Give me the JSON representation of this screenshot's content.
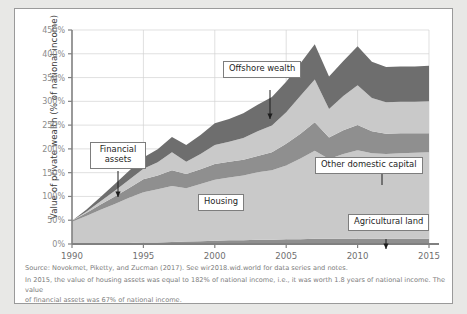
{
  "chart_data": {
    "type": "area",
    "stacked": true,
    "title": "",
    "subtitle": "",
    "xlabel": "",
    "ylabel": "Value of private wealth (% of national income)",
    "xlim": [
      1990,
      2015
    ],
    "ylim": [
      0,
      450
    ],
    "ytick_labels": [
      "0%",
      "50%",
      "100%",
      "150%",
      "200%",
      "250%",
      "300%",
      "350%",
      "400%",
      "450%"
    ],
    "ytick_values": [
      0,
      50,
      100,
      150,
      200,
      250,
      300,
      350,
      400,
      450
    ],
    "xtick_labels": [
      "1990",
      "1995",
      "2000",
      "2005",
      "2010",
      "2015"
    ],
    "xtick_values": [
      1990,
      1995,
      2000,
      2005,
      2010,
      2015
    ],
    "grid": true,
    "legend_position": "annotations",
    "x": [
      1990,
      1991,
      1992,
      1993,
      1994,
      1995,
      1996,
      1997,
      1998,
      1999,
      2000,
      2001,
      2002,
      2003,
      2004,
      2005,
      2006,
      2007,
      2008,
      2009,
      2010,
      2011,
      2012,
      2013,
      2014,
      2015
    ],
    "series": [
      {
        "name": "Agricultural land",
        "color": "#8f8f8f",
        "values": [
          2,
          2,
          2,
          2,
          2,
          3,
          3,
          4,
          5,
          6,
          7,
          8,
          8,
          9,
          9,
          10,
          10,
          11,
          11,
          11,
          11,
          11,
          11,
          11,
          11,
          11
        ]
      },
      {
        "name": "Housing",
        "color": "#c9c9c9",
        "values": [
          45,
          57,
          70,
          82,
          95,
          106,
          112,
          118,
          112,
          120,
          128,
          132,
          136,
          142,
          146,
          155,
          170,
          185,
          168,
          178,
          186,
          180,
          178,
          180,
          181,
          182
        ]
      },
      {
        "name": "Other domestic capital",
        "color": "#8f8f8f",
        "values": [
          2,
          6,
          11,
          16,
          21,
          27,
          29,
          33,
          30,
          31,
          33,
          33,
          33,
          34,
          38,
          46,
          52,
          60,
          45,
          50,
          53,
          46,
          43,
          42,
          41,
          40
        ]
      },
      {
        "name": "Financial assets",
        "color": "#c9c9c9",
        "values": [
          0,
          3,
          7,
          12,
          17,
          22,
          28,
          38,
          26,
          32,
          40,
          42,
          46,
          52,
          56,
          66,
          80,
          90,
          60,
          72,
          84,
          70,
          66,
          66,
          66,
          67
        ]
      },
      {
        "name": "Offshore wealth",
        "color": "#6e6e6e",
        "values": [
          0,
          4,
          9,
          14,
          19,
          24,
          27,
          32,
          35,
          40,
          46,
          48,
          52,
          56,
          60,
          64,
          68,
          74,
          68,
          74,
          82,
          76,
          74,
          74,
          74,
          75
        ]
      }
    ]
  },
  "annotations": [
    {
      "id": "financial-assets",
      "label": "Financial assets",
      "multiline": true
    },
    {
      "id": "offshore-wealth",
      "label": "Offshore wealth",
      "multiline": false
    },
    {
      "id": "housing",
      "label": "Housing",
      "multiline": false
    },
    {
      "id": "other-domestic-capital",
      "label": "Other domestic capital",
      "multiline": false
    },
    {
      "id": "agricultural-land",
      "label": "Agricultural land",
      "multiline": false
    }
  ],
  "footnotes": {
    "source": "Source:  Novokmet, Piketty, and Zucman (2017). See wir2018.wid.world for data series and notes.",
    "note_line1": "In 2015, the value of housing assets was equal to 182% of national income, i.e., it was worth 1.8 years of national income. The value",
    "note_line2": "of financial assets was 67% of national income."
  },
  "colors": {
    "light_band": "#c9c9c9",
    "mid_band": "#8f8f8f",
    "dark_band": "#6e6e6e",
    "axis": "#808080",
    "grid": "#d3d3d3",
    "text": "#3a3a3a",
    "muted_text": "#7c7c7c"
  }
}
